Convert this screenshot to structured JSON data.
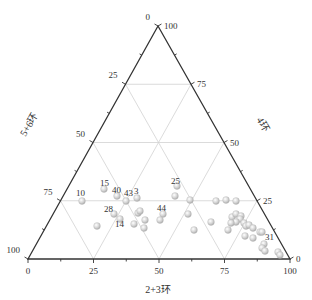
{
  "chart_data": {
    "type": "scatter",
    "subtype": "ternary",
    "title": "",
    "axes": {
      "bottom": {
        "label": "2+3环",
        "ticks": [
          0,
          25,
          50,
          75,
          100
        ],
        "direction": "left-to-right"
      },
      "left": {
        "label": "5+6环",
        "ticks": [
          0,
          25,
          50,
          75,
          100
        ],
        "direction": "top-to-bottom-left"
      },
      "right": {
        "label": "4环",
        "ticks": [
          0,
          25,
          50,
          75,
          100
        ],
        "direction": "bottom-right-to-top"
      }
    },
    "vertices": {
      "top": "4环 = 100",
      "bottom_left": "5+6环 = 100",
      "bottom_right": "2+3环 = 100"
    },
    "grid": true,
    "grid_step": 25,
    "marker_color": "#c8c8c8",
    "point_labels": [
      "10",
      "15",
      "40",
      "43",
      "3",
      "28",
      "14",
      "44",
      "25",
      "31"
    ],
    "points": [
      {
        "label": "10",
        "ring23": 21,
        "ring4": 25,
        "ring56": 54
      },
      {
        "label": "15",
        "ring23": 27,
        "ring4": 30,
        "ring56": 43
      },
      {
        "label": "40",
        "ring23": 31,
        "ring4": 27,
        "ring56": 42
      },
      {
        "label": "43",
        "ring23": 35,
        "ring4": 25,
        "ring56": 40
      },
      {
        "label": "3",
        "ring23": 39,
        "ring4": 26,
        "ring56": 35
      },
      {
        "label": "28",
        "ring23": 35,
        "ring4": 19,
        "ring56": 46
      },
      {
        "label": "",
        "ring23": 38,
        "ring4": 17,
        "ring56": 45
      },
      {
        "label": "14",
        "ring23": 44,
        "ring4": 15,
        "ring56": 41
      },
      {
        "label": "",
        "ring23": 29,
        "ring4": 14,
        "ring56": 57
      },
      {
        "label": "",
        "ring23": 44,
        "ring4": 20,
        "ring56": 36
      },
      {
        "label": "",
        "ring23": 45,
        "ring4": 21,
        "ring56": 34
      },
      {
        "label": "",
        "ring23": 48,
        "ring4": 17,
        "ring56": 35
      },
      {
        "label": "",
        "ring23": 49,
        "ring4": 13,
        "ring56": 38
      },
      {
        "label": "44",
        "ring23": 55,
        "ring4": 19,
        "ring56": 26
      },
      {
        "label": "",
        "ring23": 55,
        "ring4": 17,
        "ring56": 28
      },
      {
        "label": "25",
        "ring23": 58,
        "ring4": 32,
        "ring56": 10
      },
      {
        "label": "",
        "ring23": 59,
        "ring4": 27,
        "ring56": 14
      },
      {
        "label": "",
        "ring23": 63,
        "ring4": 25,
        "ring56": 12
      },
      {
        "label": "",
        "ring23": 73,
        "ring4": 25,
        "ring56": 2
      },
      {
        "label": "",
        "ring23": 77,
        "ring4": 25,
        "ring56": -2
      },
      {
        "label": "",
        "ring23": 80,
        "ring4": 25,
        "ring56": -5
      },
      {
        "label": "",
        "ring23": 66,
        "ring4": 19,
        "ring56": 15
      },
      {
        "label": "",
        "ring23": 76,
        "ring4": 16,
        "ring56": 8
      },
      {
        "label": "",
        "ring23": 72,
        "ring4": 12,
        "ring56": 16
      },
      {
        "label": "",
        "ring23": 83,
        "ring4": 12,
        "ring56": 5
      },
      {
        "label": "",
        "ring23": 83,
        "ring4": 18,
        "ring56": -1
      },
      {
        "label": "",
        "ring23": 84,
        "ring4": 19,
        "ring56": -3
      },
      {
        "label": "",
        "ring23": 86,
        "ring4": 18,
        "ring56": -4
      },
      {
        "label": "",
        "ring23": 86,
        "ring4": 17,
        "ring56": -3
      },
      {
        "label": "",
        "ring23": 84,
        "ring4": 16,
        "ring56": 0
      },
      {
        "label": "",
        "ring23": 82,
        "ring4": 16,
        "ring56": 2
      },
      {
        "label": "",
        "ring23": 87,
        "ring4": 16,
        "ring56": -3
      },
      {
        "label": "",
        "ring23": 88,
        "ring4": 14,
        "ring56": -2
      },
      {
        "label": "",
        "ring23": 89,
        "ring4": 15,
        "ring56": -4
      },
      {
        "label": "",
        "ring23": 90,
        "ring4": 13,
        "ring56": -3
      },
      {
        "label": "",
        "ring23": 90,
        "ring4": 10,
        "ring56": 0
      },
      {
        "label": "",
        "ring23": 92,
        "ring4": 9,
        "ring56": -1
      },
      {
        "label": "",
        "ring23": 94,
        "ring4": 11,
        "ring56": -5
      },
      {
        "label": "",
        "ring23": 95,
        "ring4": 11,
        "ring56": -6
      },
      {
        "label": "31",
        "ring23": 95,
        "ring4": 6,
        "ring56": -1
      },
      {
        "label": "",
        "ring23": 94,
        "ring4": 5,
        "ring56": 1
      },
      {
        "label": "",
        "ring23": 95,
        "ring4": 3,
        "ring56": 2
      },
      {
        "label": "",
        "ring23": 100,
        "ring4": 3,
        "ring56": -3
      },
      {
        "label": "",
        "ring23": 100,
        "ring4": 2,
        "ring56": -2
      }
    ],
    "pixel_points": [
      [
        82,
        201
      ],
      [
        104,
        189
      ],
      [
        117,
        196
      ],
      [
        126,
        201
      ],
      [
        137,
        198
      ],
      [
        114,
        214
      ],
      [
        120,
        219
      ],
      [
        134,
        224
      ],
      [
        97,
        226
      ],
      [
        138,
        213
      ],
      [
        140,
        211
      ],
      [
        145,
        220
      ],
      [
        144,
        228
      ],
      [
        163,
        214
      ],
      [
        160,
        220
      ],
      [
        177,
        186
      ],
      [
        175,
        196
      ],
      [
        190,
        200
      ],
      [
        216,
        201
      ],
      [
        226,
        200
      ],
      [
        236,
        201
      ],
      [
        188,
        214
      ],
      [
        211,
        222
      ],
      [
        194,
        230
      ],
      [
        228,
        230
      ],
      [
        232,
        217
      ],
      [
        236,
        214
      ],
      [
        241,
        216
      ],
      [
        240,
        219
      ],
      [
        236,
        222
      ],
      [
        231,
        223
      ],
      [
        244,
        223
      ],
      [
        246,
        226
      ],
      [
        249,
        225
      ],
      [
        253,
        228
      ],
      [
        245,
        236
      ],
      [
        253,
        238
      ],
      [
        260,
        232
      ],
      [
        262,
        232
      ],
      [
        264,
        244
      ],
      [
        262,
        248
      ],
      [
        265,
        251
      ],
      [
        278,
        252
      ],
      [
        280,
        255
      ]
    ],
    "labels_pixel": [
      {
        "text": "10",
        "x": 76,
        "y": 196
      },
      {
        "text": "15",
        "x": 100,
        "y": 186
      },
      {
        "text": "40",
        "x": 112,
        "y": 193
      },
      {
        "text": "43",
        "x": 124,
        "y": 196
      },
      {
        "text": "3",
        "x": 134,
        "y": 194
      },
      {
        "text": "28",
        "x": 104,
        "y": 212
      },
      {
        "text": "14",
        "x": 115,
        "y": 227
      },
      {
        "text": "44",
        "x": 157,
        "y": 211
      },
      {
        "text": "25",
        "x": 171,
        "y": 184
      },
      {
        "text": "31",
        "x": 265,
        "y": 240
      }
    ]
  },
  "geometry": {
    "top": [
      158,
      26
    ],
    "left": [
      28,
      259
    ],
    "right": [
      290,
      259
    ]
  },
  "tick_labels": {
    "bottom": [
      "0",
      "25",
      "50",
      "75",
      "100"
    ],
    "left": [
      "0",
      "25",
      "50",
      "75",
      "100"
    ],
    "right": [
      "0",
      "25",
      "50",
      "75",
      "100"
    ]
  },
  "axis_titles": {
    "bottom": "2+3环",
    "left": "5+6环",
    "right": "4环"
  }
}
